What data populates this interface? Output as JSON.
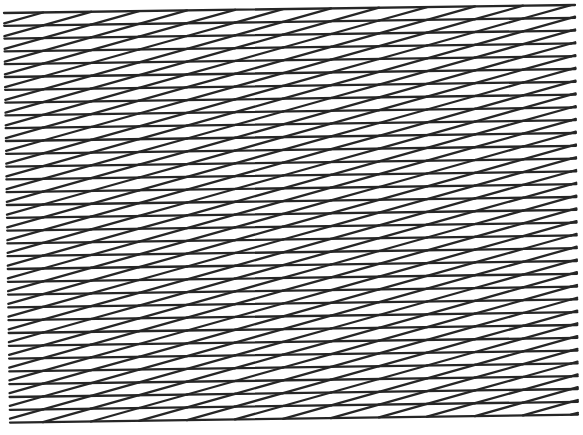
{
  "figure": {
    "width": 583,
    "height": 435,
    "background": "#ffffff",
    "stroke_color": "#262626",
    "stroke_width": 2.3,
    "pattern": "zigzag-line-grating",
    "horizontal_lines": {
      "count": 33,
      "left_x_top": 4,
      "left_x_bottom": 10,
      "right_x_top": 575,
      "right_x_bottom": 578,
      "left_y_first": 13,
      "right_y_first": 5,
      "spacing": 12.8,
      "rise_across_width": 8
    },
    "diagonals": {
      "per_band": 12,
      "pitch_x": 48,
      "first_top_x": 43,
      "span_x": 48,
      "direction": "rising-left-to-right"
    }
  }
}
